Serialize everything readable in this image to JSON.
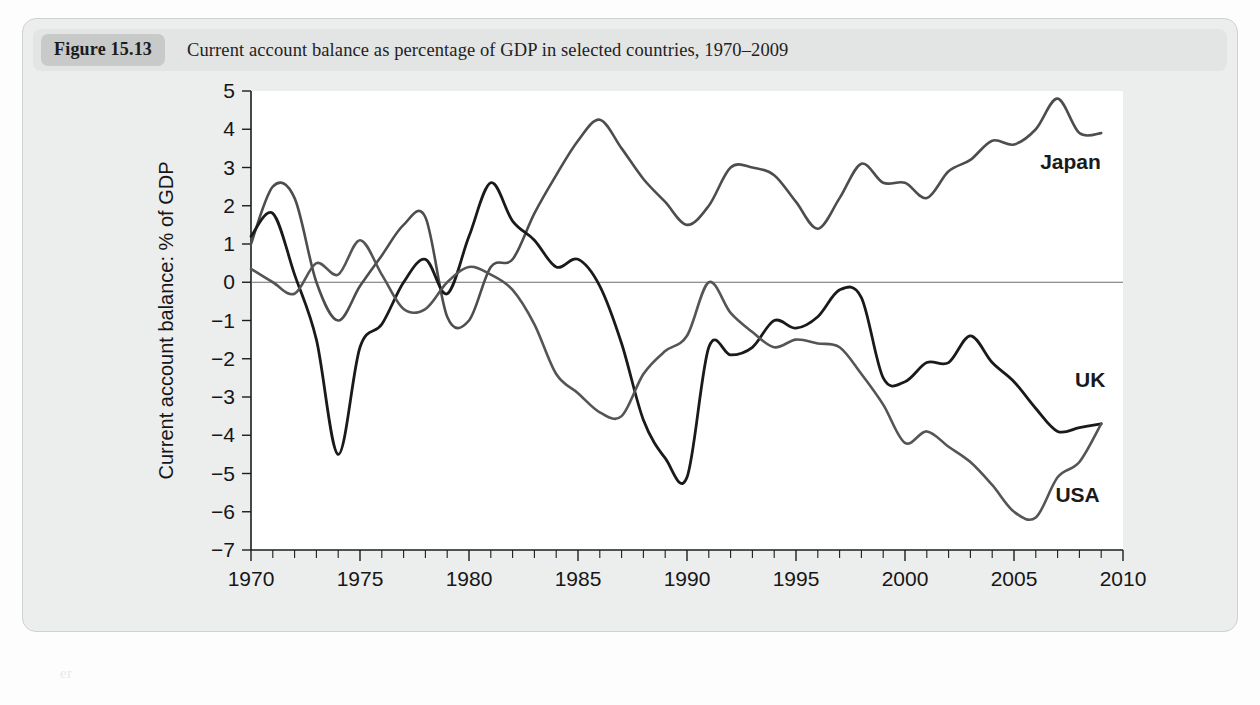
{
  "figure": {
    "badge": "Figure 15.13",
    "caption": "Current account balance as percentage of GDP in selected countries, 1970–2009"
  },
  "labels": {
    "japan": "Japan",
    "uk": "UK",
    "usa": "USA"
  },
  "ghost_text": {
    "l1": "the balance of payments account",
    "l2": "rs account",
    "l3": "er"
  },
  "chart_data": {
    "type": "line",
    "title": "Current account balance as percentage of GDP in selected countries, 1970–2009",
    "xlabel": "",
    "ylabel": "Current account balance: % of GDP",
    "xlim": [
      1970,
      2010
    ],
    "ylim": [
      -7,
      5
    ],
    "grid": false,
    "legend_position": "inline-right",
    "x_ticks": [
      1970,
      1975,
      1980,
      1985,
      1990,
      1995,
      2000,
      2005,
      2010
    ],
    "x_minor_tick_interval": 1,
    "y_ticks": [
      5,
      4,
      3,
      2,
      1,
      0,
      -1,
      -2,
      -3,
      -4,
      -5,
      -6,
      -7
    ],
    "zero_reference_line": 0,
    "x": [
      1970,
      1971,
      1972,
      1973,
      1974,
      1975,
      1976,
      1977,
      1978,
      1979,
      1980,
      1981,
      1982,
      1983,
      1984,
      1985,
      1986,
      1987,
      1988,
      1989,
      1990,
      1991,
      1992,
      1993,
      1994,
      1995,
      1996,
      1997,
      1998,
      1999,
      2000,
      2001,
      2002,
      2003,
      2004,
      2005,
      2006,
      2007,
      2008,
      2009
    ],
    "series": [
      {
        "name": "Japan",
        "color": "#4d4d4d",
        "width": 2.6,
        "values": [
          1.0,
          2.5,
          2.2,
          0.0,
          -1.0,
          -0.1,
          0.7,
          1.5,
          1.7,
          -0.9,
          -1.0,
          0.4,
          0.6,
          1.8,
          2.8,
          3.7,
          4.25,
          3.5,
          2.7,
          2.1,
          1.5,
          2.0,
          3.0,
          3.0,
          2.8,
          2.1,
          1.4,
          2.2,
          3.1,
          2.6,
          2.6,
          2.2,
          2.9,
          3.2,
          3.7,
          3.6,
          4.0,
          4.8,
          3.9,
          3.9
        ]
      },
      {
        "name": "UK",
        "color": "#1a1a1a",
        "width": 2.8,
        "values": [
          1.2,
          1.8,
          0.2,
          -1.5,
          -4.5,
          -1.7,
          -1.1,
          0.0,
          0.6,
          -0.3,
          1.2,
          2.6,
          1.6,
          1.1,
          0.4,
          0.6,
          -0.1,
          -1.6,
          -3.6,
          -4.6,
          -5.1,
          -1.7,
          -1.9,
          -1.7,
          -1.0,
          -1.2,
          -0.9,
          -0.2,
          -0.4,
          -2.5,
          -2.6,
          -2.1,
          -2.1,
          -1.4,
          -2.1,
          -2.6,
          -3.3,
          -3.9,
          -3.8,
          -3.7
        ]
      },
      {
        "name": "USA",
        "color": "#555555",
        "width": 2.6,
        "values": [
          0.35,
          0.0,
          -0.3,
          0.5,
          0.2,
          1.1,
          0.2,
          -0.7,
          -0.7,
          0.0,
          0.4,
          0.2,
          -0.2,
          -1.1,
          -2.4,
          -2.9,
          -3.4,
          -3.5,
          -2.4,
          -1.8,
          -1.4,
          0.0,
          -0.8,
          -1.3,
          -1.7,
          -1.5,
          -1.6,
          -1.7,
          -2.4,
          -3.2,
          -4.2,
          -3.9,
          -4.3,
          -4.7,
          -5.3,
          -6.0,
          -6.15,
          -5.1,
          -4.7,
          -3.7
        ]
      }
    ]
  }
}
